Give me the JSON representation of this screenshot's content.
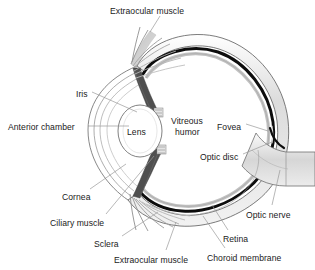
{
  "figure": {
    "style": "grayscale line drawing",
    "background_color": "#ffffff",
    "text_color": "#1a1a1a"
  },
  "palette": {
    "outline": "#555555",
    "sclera_fill": "#d9d9d9",
    "choroid_black": "#0d0d0d",
    "retina_gray": "#bfbfbf",
    "iris_dark": "#4a4a4a",
    "muscle_gray": "#9a9a9a",
    "nerve_fill": "#d3d3d3",
    "leader_line": "#8c8c8c"
  },
  "labels": [
    {
      "id": "extraocular-muscle-top",
      "text": "Extraocular muscle",
      "x": 110,
      "y": 6
    },
    {
      "id": "iris",
      "text": "Iris",
      "x": 76,
      "y": 89
    },
    {
      "id": "anterior-chamber",
      "text": "Anterior chamber",
      "x": 8,
      "y": 122
    },
    {
      "id": "lens",
      "text": "Lens",
      "x": 127,
      "y": 127
    },
    {
      "id": "vitreous-humor-line1",
      "text": "Vitreous",
      "x": 171,
      "y": 116
    },
    {
      "id": "vitreous-humor-line2",
      "text": "humor",
      "x": 175,
      "y": 127
    },
    {
      "id": "fovea",
      "text": "Fovea",
      "x": 217,
      "y": 122
    },
    {
      "id": "optic-disc",
      "text": "Optic disc",
      "x": 200,
      "y": 152
    },
    {
      "id": "optic-nerve",
      "text": "Optic nerve",
      "x": 246,
      "y": 210
    },
    {
      "id": "cornea",
      "text": "Cornea",
      "x": 62,
      "y": 192
    },
    {
      "id": "ciliary-muscle",
      "text": "Ciliary muscle",
      "x": 50,
      "y": 218
    },
    {
      "id": "sclera",
      "text": "Sclera",
      "x": 94,
      "y": 239
    },
    {
      "id": "extraocular-muscle-bottom",
      "text": "Extraocular muscle",
      "x": 114,
      "y": 255
    },
    {
      "id": "retina",
      "text": "Retina",
      "x": 223,
      "y": 234
    },
    {
      "id": "choroid-membrane",
      "text": "Choroid membrane",
      "x": 207,
      "y": 253
    }
  ],
  "anatomy_parts": [
    "extraocular muscle",
    "iris",
    "anterior chamber",
    "lens",
    "vitreous humor",
    "fovea",
    "optic disc",
    "optic nerve",
    "cornea",
    "ciliary muscle",
    "sclera",
    "retina",
    "choroid membrane"
  ]
}
